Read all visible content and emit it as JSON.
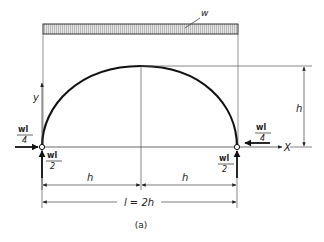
{
  "diagram": {
    "type": "structural-arch",
    "caption": "(a)",
    "load_label": "w",
    "axis_y_label": "y",
    "axis_x_label": "X",
    "rise_label": "h",
    "half_span_left_label": "h",
    "half_span_right_label": "h",
    "span_label": "l = 2h",
    "left_horizontal_reaction": {
      "num": "wl",
      "den": "4"
    },
    "left_vertical_reaction": {
      "num": "wl",
      "den": "2"
    },
    "right_horizontal_reaction": {
      "num": "wl",
      "den": "4"
    },
    "right_vertical_reaction": {
      "num": "wl",
      "den": "2"
    }
  }
}
